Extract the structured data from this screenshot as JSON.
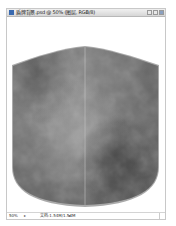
{
  "window": {
    "title": "盾牌背景.psd @ 50% (图层, RGB/8)",
    "controls": [
      "minimize",
      "maximize",
      "close"
    ]
  },
  "canvas": {
    "content": "metallic gray shield shape with textured fill and vertical center seam",
    "colors": {
      "background": "#ffffff",
      "shield_fill_light": "#9a9a9a",
      "shield_fill_dark": "#4a4a4a",
      "shield_border": "#a8a8a8",
      "seam": "#c8c8c8"
    }
  },
  "statusbar": {
    "zoom": "50%",
    "separator": "▸",
    "doc_info": "文档:1.54M/1.54M",
    "arrow": "▸"
  }
}
